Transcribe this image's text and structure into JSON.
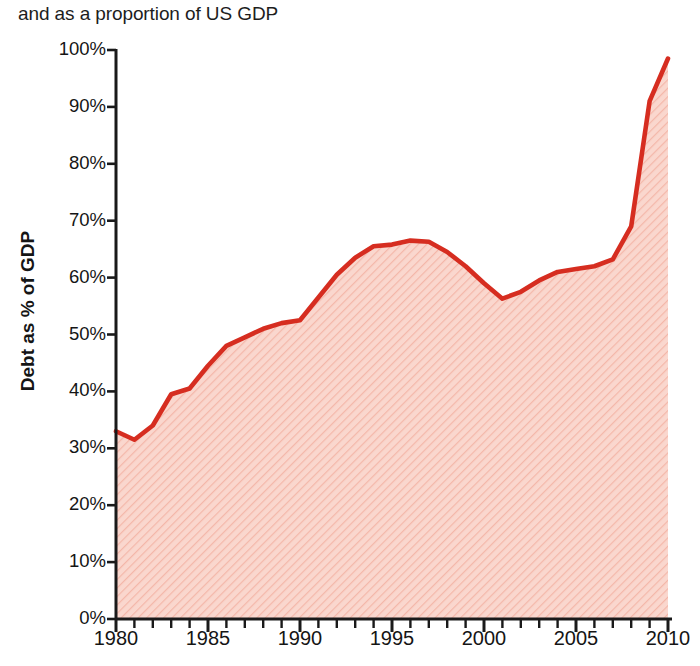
{
  "subtitle": "and as a proportion of US GDP",
  "colors": {
    "line": "#d62d20",
    "fill": "#f8cfc6",
    "hatch": "#f3b9ad",
    "axis": "#1a1a1a",
    "text": "#151515"
  },
  "chart_data": {
    "type": "area",
    "title": "and as a proportion of US GDP",
    "xlabel": "",
    "ylabel": "Debt as % of GDP",
    "xlim": [
      1980,
      2010
    ],
    "ylim": [
      0,
      100
    ],
    "grid": false,
    "legend": "none",
    "y_ticks": [
      "0%",
      "10%",
      "20%",
      "30%",
      "40%",
      "50%",
      "60%",
      "70%",
      "80%",
      "90%",
      "100%"
    ],
    "y_tick_values": [
      0,
      10,
      20,
      30,
      40,
      50,
      60,
      70,
      80,
      90,
      100
    ],
    "x_ticks": [
      "1980",
      "1985",
      "1990",
      "1995",
      "2000",
      "2005",
      "2010"
    ],
    "x_tick_values": [
      1980,
      1985,
      1990,
      1995,
      2000,
      2005,
      2010
    ],
    "x_minor_tick_interval": 1,
    "series": [
      {
        "name": "Debt as % of GDP",
        "x": [
          1980,
          1981,
          1982,
          1983,
          1984,
          1985,
          1986,
          1987,
          1988,
          1989,
          1990,
          1991,
          1992,
          1993,
          1994,
          1995,
          1996,
          1997,
          1998,
          1999,
          2000,
          2001,
          2002,
          2003,
          2004,
          2005,
          2006,
          2007,
          2008,
          2009,
          2010
        ],
        "values": [
          33.0,
          31.5,
          34.0,
          39.5,
          40.5,
          44.5,
          48.0,
          49.5,
          51.0,
          52.0,
          52.5,
          56.5,
          60.5,
          63.5,
          65.5,
          65.8,
          66.5,
          66.3,
          64.5,
          62.0,
          59.0,
          56.3,
          57.5,
          59.5,
          61.0,
          61.5,
          62.0,
          63.2,
          69.0,
          91.0,
          98.5
        ]
      }
    ]
  }
}
